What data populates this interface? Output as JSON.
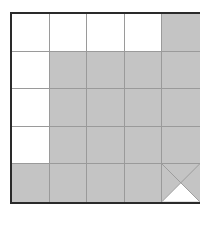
{
  "figure": {
    "rows": 5,
    "cols": 5,
    "colors": {
      "shaded": "#c4c4c4",
      "white": "#ffffff",
      "border": "#2a2a2a",
      "gridline": "#9a9a9a"
    },
    "cells": [
      [
        "white",
        "white",
        "white",
        "white",
        "shaded"
      ],
      [
        "white",
        "shaded",
        "shaded",
        "shaded",
        "shaded"
      ],
      [
        "white",
        "shaded",
        "shaded",
        "shaded",
        "shaded"
      ],
      [
        "white",
        "shaded",
        "shaded",
        "shaded",
        "shaded"
      ],
      [
        "shaded",
        "shaded",
        "shaded",
        "shaded",
        "diagonal-split"
      ]
    ],
    "special_cell": {
      "row": 4,
      "col": 4,
      "description": "cell divided by both diagonals; bottom triangle white, other three triangles shaded"
    }
  }
}
